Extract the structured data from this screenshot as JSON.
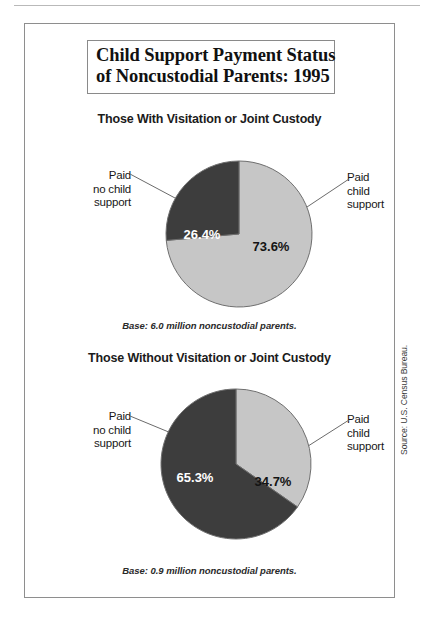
{
  "figure": {
    "title_line_1": "Child Support Payment Status",
    "title_line_2": "of Noncustodial Parents: 1995",
    "source_credit": "Source: U.S. Census Bureau."
  },
  "panels": [
    {
      "heading": "Those With Visitation or Joint Custody",
      "base_note": "Base: 6.0 million noncustodial parents.",
      "left_label": [
        "Paid",
        "no child",
        "support"
      ],
      "right_label": [
        "Paid",
        "child",
        "support"
      ],
      "dark_value_label": "26.4%",
      "light_value_label": "73.6%"
    },
    {
      "heading": "Those Without Visitation or Joint Custody",
      "base_note": "Base: 0.9 million noncustodial parents.",
      "left_label": [
        "Paid",
        "no child",
        "support"
      ],
      "right_label": [
        "Paid",
        "child",
        "support"
      ],
      "dark_value_label": "65.3%",
      "light_value_label": "34.7%"
    }
  ],
  "colors": {
    "slice_dark": "#3d3d3d",
    "slice_light": "#c6c6c6",
    "slice_outline": "#6f6f6f",
    "frame": "#8e8e8e",
    "dark_slice_text": "#ffffff",
    "light_slice_text": "#141414"
  },
  "chart_data": [
    {
      "type": "pie",
      "title": "Those With Visitation or Joint Custody",
      "subtitle": "Base: 6.0 million noncustodial parents.",
      "base_millions": 6.0,
      "legend_position": "callout-labels",
      "grid": false,
      "slices": [
        {
          "label": "Paid child support",
          "value": 73.6,
          "unit": "percent",
          "data_label": "73.6%",
          "color": "#c6c6c6",
          "start_angle_deg": 0,
          "sweep_deg": 264.96,
          "direction": "clockwise-from-12"
        },
        {
          "label": "Paid no child support",
          "value": 26.4,
          "unit": "percent",
          "data_label": "26.4%",
          "color": "#3d3d3d",
          "start_angle_deg": 264.96,
          "sweep_deg": 95.04,
          "direction": "clockwise-from-12"
        }
      ]
    },
    {
      "type": "pie",
      "title": "Those Without Visitation or Joint Custody",
      "subtitle": "Base: 0.9 million noncustodial parents.",
      "base_millions": 0.9,
      "legend_position": "callout-labels",
      "grid": false,
      "slices": [
        {
          "label": "Paid child support",
          "value": 34.7,
          "unit": "percent",
          "data_label": "34.7%",
          "color": "#c6c6c6",
          "start_angle_deg": 0,
          "sweep_deg": 124.92,
          "direction": "clockwise-from-12"
        },
        {
          "label": "Paid no child support",
          "value": 65.3,
          "unit": "percent",
          "data_label": "65.3%",
          "color": "#3d3d3d",
          "start_angle_deg": 124.92,
          "sweep_deg": 235.08,
          "direction": "clockwise-from-12"
        }
      ]
    }
  ]
}
